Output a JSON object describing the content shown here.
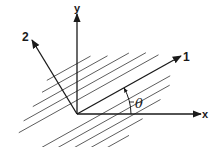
{
  "diagram": {
    "labels": {
      "x_axis": "x",
      "y_axis": "y",
      "axis_1": "1",
      "axis_2": "2",
      "angle": "θ"
    },
    "angle_description": "Angle θ measured from x-axis to axis 1",
    "colors": {
      "ink": "#1a1a1a",
      "hatch": "#333333",
      "background": "#ffffff"
    }
  }
}
